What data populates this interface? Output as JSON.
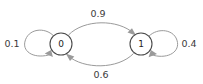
{
  "diagram": {
    "type": "state-transition-diagram",
    "title": "",
    "background_color": "#ffffff",
    "edge_color": "#9a9a9a",
    "node_stroke_color": "#4a4a4a",
    "text_color": "#3a3a3a",
    "nodes": [
      {
        "id": "state-0",
        "label": "0",
        "cx": 61,
        "cy": 44,
        "r": 11
      },
      {
        "id": "state-1",
        "label": "1",
        "cx": 141,
        "cy": 44,
        "r": 11
      }
    ],
    "edges": [
      {
        "id": "self-loop-0",
        "from": "0",
        "to": "0",
        "label": "0.1",
        "label_x": 12,
        "label_y": 44,
        "kind": "self-loop",
        "side": "left"
      },
      {
        "id": "edge-0-to-1",
        "from": "0",
        "to": "1",
        "label": "0.9",
        "label_x": 98,
        "label_y": 14,
        "kind": "arc",
        "side": "top"
      },
      {
        "id": "edge-1-to-0",
        "from": "1",
        "to": "0",
        "label": "0.6",
        "label_x": 101,
        "label_y": 75,
        "kind": "arc",
        "side": "bottom"
      },
      {
        "id": "self-loop-1",
        "from": "1",
        "to": "1",
        "label": "0.4",
        "label_x": 189,
        "label_y": 44,
        "kind": "self-loop",
        "side": "right"
      }
    ]
  }
}
